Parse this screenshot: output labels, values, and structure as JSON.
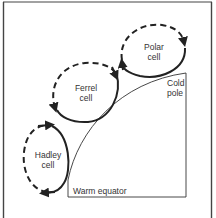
{
  "diagram": {
    "cells": [
      {
        "name": "polar",
        "line1": "Polar",
        "line2": "cell"
      },
      {
        "name": "ferrel",
        "line1": "Ferrel",
        "line2": "cell"
      },
      {
        "name": "hadley",
        "line1": "Hadley",
        "line2": "cell"
      }
    ],
    "labels": {
      "cold_pole_line1": "Cold",
      "cold_pole_line2": "pole",
      "warm_equator": "Warm equator"
    },
    "colors": {
      "stroke": "#222222",
      "text": "#333333",
      "background": "#ffffff"
    }
  }
}
